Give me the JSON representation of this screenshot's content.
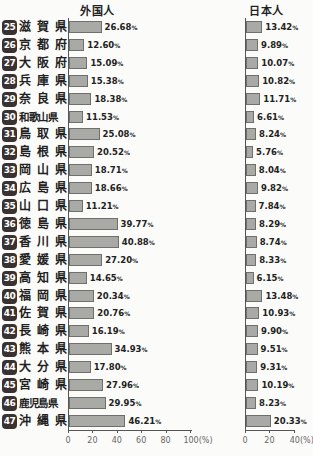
{
  "chart_data": [
    {
      "type": "bar",
      "orientation": "horizontal",
      "title": "外国人",
      "xlabel": "",
      "ylabel": "",
      "xlim": [
        0,
        100
      ],
      "x_ticks": [
        "0",
        "20",
        "40",
        "60",
        "80",
        "100(%)"
      ],
      "categories": [
        "滋賀県",
        "京都府",
        "大阪府",
        "兵庫県",
        "奈良県",
        "和歌山県",
        "鳥取県",
        "島根県",
        "岡山県",
        "広島県",
        "山口県",
        "徳島県",
        "香川県",
        "愛媛県",
        "高知県",
        "福岡県",
        "佐賀県",
        "長崎県",
        "熊本県",
        "大分県",
        "宮崎県",
        "鹿児島県",
        "沖縄県"
      ],
      "values": [
        26.68,
        12.6,
        15.09,
        15.38,
        18.38,
        11.53,
        25.08,
        20.52,
        18.71,
        18.66,
        11.21,
        39.77,
        40.88,
        27.2,
        14.65,
        20.34,
        20.76,
        16.19,
        34.93,
        17.8,
        27.96,
        29.95,
        46.21
      ],
      "grid": false
    },
    {
      "type": "bar",
      "orientation": "horizontal",
      "title": "日本人",
      "xlabel": "",
      "ylabel": "",
      "xlim": [
        0,
        40
      ],
      "x_ticks": [
        "0",
        "20",
        "40(%)"
      ],
      "categories": [
        "滋賀県",
        "京都府",
        "大阪府",
        "兵庫県",
        "奈良県",
        "和歌山県",
        "鳥取県",
        "島根県",
        "岡山県",
        "広島県",
        "山口県",
        "徳島県",
        "香川県",
        "愛媛県",
        "高知県",
        "福岡県",
        "佐賀県",
        "長崎県",
        "熊本県",
        "大分県",
        "宮崎県",
        "鹿児島県",
        "沖縄県"
      ],
      "values": [
        13.42,
        9.89,
        10.07,
        10.82,
        11.71,
        6.61,
        8.24,
        5.76,
        8.04,
        9.82,
        7.84,
        8.29,
        8.74,
        8.33,
        6.15,
        13.48,
        10.93,
        9.9,
        9.51,
        9.31,
        10.19,
        8.23,
        20.33
      ],
      "grid": false
    }
  ],
  "titles": {
    "foreign": "外国人",
    "japanese": "日本人"
  },
  "rows": [
    {
      "num": "25",
      "name": "滋賀県",
      "foreign": "26.68",
      "japanese": "13.42"
    },
    {
      "num": "26",
      "name": "京都府",
      "foreign": "12.60",
      "japanese": "9.89"
    },
    {
      "num": "27",
      "name": "大阪府",
      "foreign": "15.09",
      "japanese": "10.07"
    },
    {
      "num": "28",
      "name": "兵庫県",
      "foreign": "15.38",
      "japanese": "10.82"
    },
    {
      "num": "29",
      "name": "奈良県",
      "foreign": "18.38",
      "japanese": "11.71"
    },
    {
      "num": "30",
      "name": "和歌山県",
      "foreign": "11.53",
      "japanese": "6.61"
    },
    {
      "num": "31",
      "name": "鳥取県",
      "foreign": "25.08",
      "japanese": "8.24"
    },
    {
      "num": "32",
      "name": "島根県",
      "foreign": "20.52",
      "japanese": "5.76"
    },
    {
      "num": "33",
      "name": "岡山県",
      "foreign": "18.71",
      "japanese": "8.04"
    },
    {
      "num": "34",
      "name": "広島県",
      "foreign": "18.66",
      "japanese": "9.82"
    },
    {
      "num": "35",
      "name": "山口県",
      "foreign": "11.21",
      "japanese": "7.84"
    },
    {
      "num": "36",
      "name": "徳島県",
      "foreign": "39.77",
      "japanese": "8.29"
    },
    {
      "num": "37",
      "name": "香川県",
      "foreign": "40.88",
      "japanese": "8.74"
    },
    {
      "num": "38",
      "name": "愛媛県",
      "foreign": "27.20",
      "japanese": "8.33"
    },
    {
      "num": "39",
      "name": "高知県",
      "foreign": "14.65",
      "japanese": "6.15"
    },
    {
      "num": "40",
      "name": "福岡県",
      "foreign": "20.34",
      "japanese": "13.48"
    },
    {
      "num": "41",
      "name": "佐賀県",
      "foreign": "20.76",
      "japanese": "10.93"
    },
    {
      "num": "42",
      "name": "長崎県",
      "foreign": "16.19",
      "japanese": "9.90"
    },
    {
      "num": "43",
      "name": "熊本県",
      "foreign": "34.93",
      "japanese": "9.51"
    },
    {
      "num": "44",
      "name": "大分県",
      "foreign": "17.80",
      "japanese": "9.31"
    },
    {
      "num": "45",
      "name": "宮崎県",
      "foreign": "27.96",
      "japanese": "10.19"
    },
    {
      "num": "46",
      "name": "鹿児島県",
      "foreign": "29.95",
      "japanese": "8.23"
    },
    {
      "num": "47",
      "name": "沖縄県",
      "foreign": "46.21",
      "japanese": "20.33"
    }
  ],
  "percent_sign": "%",
  "axes": {
    "foreign_ticks": [
      {
        "v": 0,
        "label": "0"
      },
      {
        "v": 20,
        "label": "20"
      },
      {
        "v": 40,
        "label": "40"
      },
      {
        "v": 60,
        "label": "60"
      },
      {
        "v": 80,
        "label": "80"
      },
      {
        "v": 100,
        "label": "100(%)"
      }
    ],
    "japanese_ticks": [
      {
        "v": 0,
        "label": "0"
      },
      {
        "v": 20,
        "label": "20"
      },
      {
        "v": 40,
        "label": "40(%)"
      }
    ]
  }
}
